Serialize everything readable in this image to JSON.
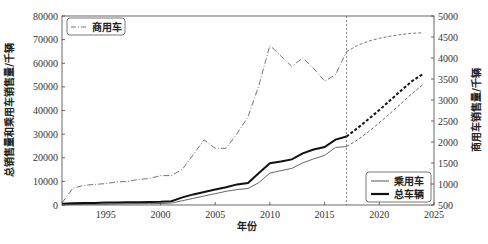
{
  "chart_data": {
    "type": "line",
    "title": "",
    "xlabel": "年份",
    "ylabel": "总销售量和乘用车销售量/千辆",
    "ylabel_right": "商用车销售量/千辆",
    "xlim": [
      1991,
      2025
    ],
    "ylim": [
      0,
      80000
    ],
    "ylim_right": [
      500,
      5000
    ],
    "xticks": [
      1995,
      2000,
      2005,
      2010,
      2015,
      2020,
      2025
    ],
    "yticks": [
      0,
      10000,
      20000,
      30000,
      40000,
      50000,
      60000,
      70000,
      80000
    ],
    "yticks_right": [
      500,
      1000,
      1500,
      2000,
      2500,
      3000,
      3500,
      4000,
      4500,
      5000
    ],
    "forecast_start": 2017,
    "grid": false,
    "legend": [
      {
        "label": "商用车",
        "position": "upper left",
        "style": "dash-dot"
      },
      {
        "label": "乘用车",
        "position": "lower right",
        "style": "thin solid"
      },
      {
        "label": "总车辆",
        "position": "lower right",
        "style": "thick solid"
      }
    ],
    "x": [
      1991,
      1992,
      1993,
      1994,
      1995,
      1996,
      1997,
      1998,
      1999,
      2000,
      2001,
      2002,
      2003,
      2004,
      2005,
      2006,
      2007,
      2008,
      2009,
      2010,
      2011,
      2012,
      2013,
      2014,
      2015,
      2016,
      2017
    ],
    "series": [
      {
        "name": "商用车",
        "axis": "right",
        "color": "#777777",
        "values": [
          550,
          900,
          970,
          990,
          1010,
          1050,
          1060,
          1110,
          1130,
          1200,
          1200,
          1350,
          1700,
          2050,
          1850,
          1850,
          2200,
          2600,
          3350,
          4300,
          4050,
          3800,
          4000,
          3750,
          3450,
          3600,
          4150
        ]
      },
      {
        "name": "乘用车",
        "axis": "left",
        "color": "#555555",
        "values": [
          100,
          200,
          300,
          350,
          400,
          450,
          500,
          550,
          600,
          650,
          800,
          1800,
          2800,
          3800,
          4800,
          5800,
          6500,
          7000,
          9500,
          13500,
          14500,
          15500,
          17800,
          19500,
          21000,
          24400,
          24700
        ]
      },
      {
        "name": "总车辆",
        "axis": "left",
        "color": "#111111",
        "values": [
          500,
          700,
          800,
          900,
          1000,
          1100,
          1150,
          1200,
          1300,
          1400,
          1600,
          3200,
          4500,
          5500,
          6500,
          7500,
          8700,
          9300,
          13600,
          17700,
          18400,
          19300,
          21900,
          23500,
          24500,
          27700,
          29000
        ]
      }
    ],
    "forecast": {
      "x": [
        2017,
        2018,
        2019,
        2020,
        2021,
        2022,
        2023,
        2024
      ],
      "series": [
        {
          "name": "商用车",
          "axis": "right",
          "values": [
            4150,
            4300,
            4400,
            4470,
            4520,
            4560,
            4590,
            4600
          ]
        },
        {
          "name": "乘用车",
          "axis": "left",
          "values": [
            24700,
            27500,
            31000,
            34800,
            38800,
            43000,
            47200,
            51000
          ]
        },
        {
          "name": "总车辆",
          "axis": "left",
          "values": [
            29000,
            32500,
            36300,
            40200,
            44300,
            48500,
            52500,
            55500
          ]
        }
      ]
    }
  },
  "labels": {
    "xlabel": "年份",
    "ylabel_left": "总销售量和乘用车销售量/千辆",
    "ylabel_right": "商用车销售量/千辆",
    "legend_commercial": "商用车",
    "legend_passenger": "乘用车",
    "legend_total": "总车辆"
  }
}
